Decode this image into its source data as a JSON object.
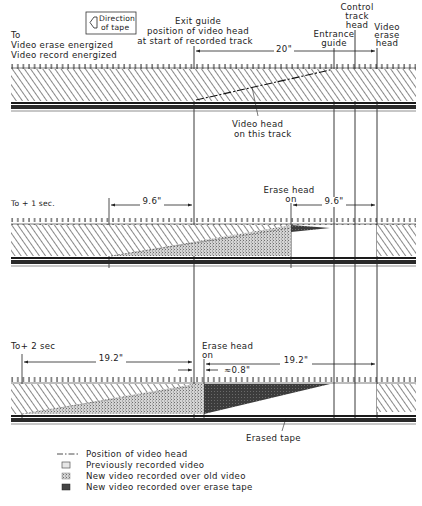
{
  "diagram": {
    "direction_box": {
      "icon": "direction-arrow-icon",
      "line1": "Direction",
      "line2": "of tape"
    },
    "top_labels": {
      "to": "To",
      "video_erase": "Video erase energized",
      "video_record": "Video record energized",
      "exit_guide_1": "Exit guide",
      "exit_guide_2": "position of video head",
      "exit_guide_3": "at start of recorded track",
      "entrance_guide_1": "Entrance",
      "entrance_guide_2": "guide",
      "control_track_1": "Control",
      "control_track_2": "track",
      "control_track_3": "head",
      "video_erase_head_1": "Video",
      "video_erase_head_2": "erase",
      "video_erase_head_3": "head",
      "dim_20": "20\""
    },
    "panel1": {
      "callout_1": "Video head",
      "callout_2": "on this track"
    },
    "panel2": {
      "time_label": "To + 1 sec.",
      "dim_left": "9.6\"",
      "erase_head_1": "Erase head",
      "erase_head_2": "on",
      "dim_right": "9.6\""
    },
    "panel3": {
      "time_label": "To+ 2 sec",
      "dim_left": "19.2\"",
      "erase_head_1": "Erase head",
      "erase_head_2": "on",
      "dim_small": "≈0.8\"",
      "dim_right": "19.2\"",
      "erased_tape": "Erased tape"
    },
    "legend": [
      {
        "swatch": "dash-dot-line",
        "label": "Position of video head"
      },
      {
        "swatch": "previously-recorded",
        "label": "Previously recorded video"
      },
      {
        "swatch": "new-over-old",
        "label": "New  video recorded  over old video"
      },
      {
        "swatch": "new-over-erase",
        "label": "New  video recorded  over erase tape"
      }
    ],
    "colors": {
      "line": "#1a1a1a",
      "hatch": "#6f6f6f",
      "stipple": "#8a8a8a",
      "dark_fill": "#3a3a3a",
      "background": "#ffffff"
    }
  }
}
